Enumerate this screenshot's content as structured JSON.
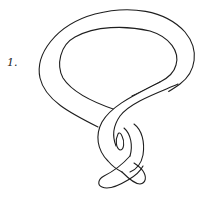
{
  "figure": {
    "label": "1.",
    "stroke_color": "#1e1e1e",
    "background": "#ffffff"
  }
}
